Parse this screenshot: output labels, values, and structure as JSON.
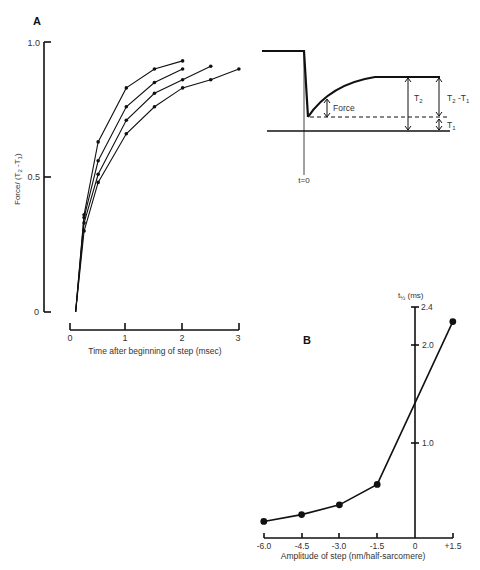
{
  "panels": {
    "a_label": "A",
    "b_label": "B"
  },
  "chart_data": [
    {
      "id": "A",
      "type": "line",
      "title": "",
      "xlabel": "Time after beginning of step (msec)",
      "ylabel": "Force/ (T2-T1)",
      "xlim": [
        0,
        3
      ],
      "ylim": [
        0,
        1.0
      ],
      "xticks": [
        "0",
        "1",
        "2",
        "3"
      ],
      "yticks": [
        "0",
        "0.5",
        "1.0"
      ],
      "grid": false,
      "legend": null,
      "series": [
        {
          "name": "curve 1",
          "x": [
            0.1,
            0.25,
            0.5,
            1.0,
            1.5,
            2.0
          ],
          "y": [
            0,
            0.36,
            0.63,
            0.83,
            0.9,
            0.93
          ]
        },
        {
          "name": "curve 2",
          "x": [
            0.1,
            0.25,
            0.5,
            1.0,
            1.5,
            2.0
          ],
          "y": [
            0,
            0.35,
            0.56,
            0.76,
            0.85,
            0.9
          ]
        },
        {
          "name": "curve 3",
          "x": [
            0.1,
            0.25,
            0.5,
            1.0,
            1.5,
            2.0,
            2.5
          ],
          "y": [
            0,
            0.33,
            0.51,
            0.71,
            0.81,
            0.86,
            0.91
          ]
        },
        {
          "name": "curve 4",
          "x": [
            0.1,
            0.25,
            0.5,
            1.0,
            1.5,
            2.0,
            2.5,
            3.0
          ],
          "y": [
            0,
            0.3,
            0.48,
            0.66,
            0.76,
            0.83,
            0.86,
            0.9
          ]
        }
      ]
    },
    {
      "id": "A-inset",
      "type": "diagram",
      "labels": {
        "force": "Force",
        "t2": "T2",
        "t2_minus_t1": "T2-T1",
        "t1": "T1",
        "t0": "t=0"
      }
    },
    {
      "id": "B",
      "type": "line",
      "title": "",
      "xlabel": "Amplitude of step (nm/half-sarcomere)",
      "ylabel": "t½ (ms)",
      "xlim": [
        -6.0,
        1.5
      ],
      "ylim": [
        0,
        2.4
      ],
      "xticks": [
        "-6.0",
        "-4.5",
        "-3.0",
        "-1.5",
        "0",
        "+1.5"
      ],
      "yticks": [
        "1.0",
        "2.0",
        "2.4"
      ],
      "grid": false,
      "legend": null,
      "series": [
        {
          "name": "t½",
          "x": [
            -6.0,
            -4.5,
            -3.0,
            -1.5,
            1.5
          ],
          "y": [
            0.17,
            0.24,
            0.34,
            0.55,
            2.22
          ]
        }
      ]
    }
  ],
  "axis_text": {
    "a": {
      "ylabel_main": "Force/ (T",
      "ylabel_sub2": "2",
      "ylabel_mid": " -T",
      "ylabel_sub1": "1",
      "ylabel_end": ")",
      "yt0": "0",
      "yt05": "0.5",
      "yt1": "1.0",
      "xt0": "0",
      "xt1": "1",
      "xt2": "2",
      "xt3": "3",
      "xlabel": "Time after beginning of step (msec)"
    },
    "inset": {
      "force": "Force",
      "t2": "T",
      "t2_sub": "2",
      "t21": "T",
      "t21_sub_a": "2",
      "t21_mid": " -T",
      "t21_sub_b": "1",
      "t1": "T",
      "t1_sub": "1",
      "t0": "t=0"
    },
    "b": {
      "ylabel": "t",
      "ylabel_sub": "½",
      "ylabel_unit": " (ms)",
      "yt24": "2.4",
      "yt20": "2.0",
      "yt10": "1.0",
      "xt": [
        "-6.0",
        "-4.5",
        "-3.0",
        "-1.5",
        "0",
        "+1.5"
      ],
      "xlabel": "Amplitude of step (nm/half-sarcomere)"
    }
  }
}
